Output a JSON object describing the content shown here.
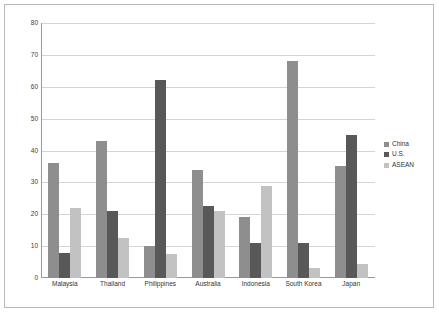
{
  "chart_data": {
    "type": "bar",
    "title": "",
    "subtitle": "",
    "xlabel": "",
    "ylabel": "",
    "ylim": [
      0,
      80
    ],
    "ytick_step": 10,
    "yticks": [
      "0",
      "10",
      "20",
      "30",
      "40",
      "50",
      "60",
      "70",
      "80"
    ],
    "grid": true,
    "legend_position": "right",
    "categories": [
      "Malaysia",
      "Thailand",
      "Philippines",
      "Australia",
      "Indonesia",
      "South Korea",
      "Japan"
    ],
    "series": [
      {
        "name": "China",
        "color": "#8e8e8e",
        "values": [
          36,
          43,
          10,
          34,
          19,
          68,
          35
        ]
      },
      {
        "name": "U.S.",
        "color": "#585858",
        "values": [
          8,
          21,
          62,
          22.5,
          11,
          11,
          45
        ]
      },
      {
        "name": "ASEAN",
        "color": "#c2c2c2",
        "values": [
          22,
          12.5,
          7.5,
          21,
          29,
          3,
          4.5
        ]
      }
    ]
  }
}
